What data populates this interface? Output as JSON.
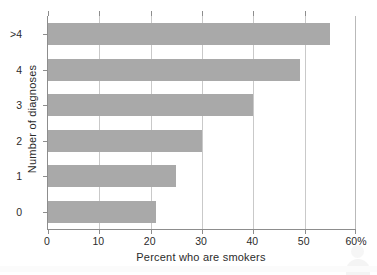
{
  "chart_data": {
    "type": "bar",
    "orientation": "horizontal",
    "title": "",
    "xlabel": "Percent who are smokers",
    "ylabel": "Number of diagnoses",
    "categories": [
      "0",
      "1",
      "2",
      "3",
      "4",
      ">4"
    ],
    "values": [
      21,
      25,
      30,
      40,
      49,
      55
    ],
    "bars": [
      {
        "category": ">4",
        "value": 55
      },
      {
        "category": "4",
        "value": 49
      },
      {
        "category": "3",
        "value": 40
      },
      {
        "category": "2",
        "value": 30
      },
      {
        "category": "1",
        "value": 25
      },
      {
        "category": "0",
        "value": 21
      }
    ],
    "xlim": [
      0,
      60
    ],
    "xticks": [
      0,
      10,
      20,
      30,
      40,
      50,
      60
    ],
    "xtick_labels": [
      "0",
      "10",
      "20",
      "30",
      "40",
      "50",
      "60%"
    ],
    "ytick_labels": [
      ">4",
      "4",
      "3",
      "2",
      "1",
      "0"
    ],
    "grid": "vertical",
    "legend": "none",
    "bar_color": "#a9a9a9",
    "axis_color": "#8d8d8d",
    "gridline_color": "#c9c9c9",
    "units": "percent"
  }
}
